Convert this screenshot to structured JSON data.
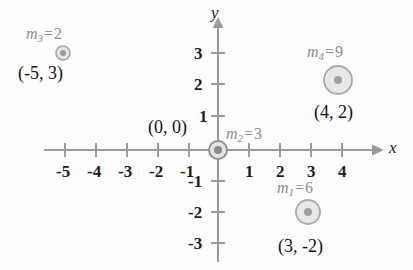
{
  "figure": {
    "type": "coordinate-plane-point-masses",
    "axis_x_label": "x",
    "axis_y_label": "y",
    "origin_label": "(0, 0)"
  },
  "axes": {
    "x_ticks": [
      "-5",
      "-4",
      "-3",
      "-2",
      "-1",
      "1",
      "2",
      "3",
      "4"
    ],
    "y_ticks": [
      "3",
      "2",
      "1",
      "-1",
      "-2",
      "-3"
    ],
    "x_range": [
      -5.6,
      4.9
    ],
    "y_range": [
      -3.6,
      3.6
    ],
    "grid": false
  },
  "points": [
    {
      "id": "m1",
      "mass_prefix": "m",
      "mass_sub": "1",
      "mass_eq": "=",
      "mass_value": "6",
      "mass_label": "m_1 = 6",
      "coord_label": "(3, -2)",
      "x": 3,
      "y": -2,
      "radius_px": 12
    },
    {
      "id": "m2",
      "mass_prefix": "m",
      "mass_sub": "2",
      "mass_eq": "=",
      "mass_value": "3",
      "mass_label": "m_2 = 3",
      "coord_label": "(0, 0)",
      "x": 0,
      "y": 0,
      "radius_px": 9
    },
    {
      "id": "m3",
      "mass_prefix": "m",
      "mass_sub": "3",
      "mass_eq": "=",
      "mass_value": "2",
      "mass_label": "m_3 = 2",
      "coord_label": "(-5, 3)",
      "x": -5,
      "y": 3,
      "radius_px": 7
    },
    {
      "id": "m4",
      "mass_prefix": "m",
      "mass_sub": "4",
      "mass_eq": "=",
      "mass_value": "9",
      "mass_label": "m_4 = 9",
      "coord_label": "(4, 2)",
      "x": 4,
      "y": 2,
      "radius_px": 14
    }
  ],
  "colors": {
    "axis": "#9a9a9a",
    "text": "#1a1a1a",
    "mass_text": "#8c8c8c",
    "circle_fill": "#e8e8e8",
    "circle_stroke": "#a8a8a8",
    "center_dot": "#9e9e9e",
    "background": "#fdfdfd"
  }
}
